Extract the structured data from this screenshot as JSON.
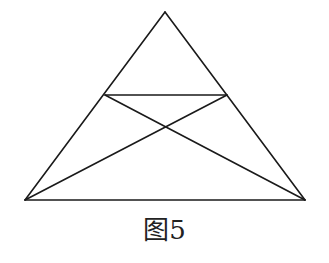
{
  "figure": {
    "caption": "图5",
    "stroke_color": "#1a1a1a",
    "background": "#ffffff",
    "points": {
      "apex": [
        165,
        12
      ],
      "bottom_left": [
        25,
        200
      ],
      "bottom_right": [
        305,
        200
      ],
      "mid_left": [
        105,
        95
      ],
      "mid_right": [
        227,
        95
      ],
      "intersection": [
        166,
        127
      ]
    },
    "segments": [
      {
        "name": "side-left",
        "from": "apex",
        "to": "bottom_left"
      },
      {
        "name": "side-right",
        "from": "apex",
        "to": "bottom_right"
      },
      {
        "name": "base",
        "from": "bottom_left",
        "to": "bottom_right"
      },
      {
        "name": "parallel-segment",
        "from": "mid_left",
        "to": "mid_right"
      },
      {
        "name": "diagonal-1",
        "from": "mid_left",
        "to": "bottom_right"
      },
      {
        "name": "diagonal-2",
        "from": "mid_right",
        "to": "bottom_left"
      }
    ]
  }
}
